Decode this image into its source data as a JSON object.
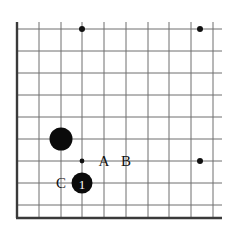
{
  "diagram": {
    "kind": "go-board-corner-diagram",
    "background_color": "#ffffff",
    "line_color": "#6e6e6e",
    "border_color": "#3a3a3a",
    "stone_color": "#0b0b0b",
    "number_color": "#ffffff",
    "label_color": "#111111",
    "grid": {
      "x_lines": [
        17,
        39,
        61,
        82,
        104,
        126,
        148,
        169,
        191,
        213
      ],
      "y_lines": [
        29,
        51,
        73,
        95,
        117,
        139,
        161,
        183,
        205
      ],
      "left_border_x": 17,
      "bottom_border_y": 218,
      "line_extent_right": 222,
      "line_extent_top": 22,
      "spacing": 21.8
    },
    "star_points": [
      {
        "name": "star-top-left",
        "x": 82,
        "y": 29
      },
      {
        "name": "star-top-right",
        "x": 200,
        "y": 29
      },
      {
        "name": "star-right",
        "x": 200,
        "y": 161
      }
    ],
    "marker_dots": [
      {
        "name": "intersection-dot",
        "x": 82,
        "y": 161,
        "r": 2.4
      }
    ],
    "stones": [
      {
        "name": "black-stone-plain",
        "color": "black",
        "x": 61,
        "y": 139,
        "r": 11.5,
        "number": ""
      },
      {
        "name": "black-stone-move-1",
        "color": "black",
        "x": 82,
        "y": 183,
        "r": 10.5,
        "number": "1"
      }
    ],
    "labels": [
      {
        "name": "label-a",
        "text": "A",
        "x": 104,
        "y": 161
      },
      {
        "name": "label-b",
        "text": "B",
        "x": 126,
        "y": 161
      },
      {
        "name": "label-c",
        "text": "C",
        "x": 61,
        "y": 183
      }
    ]
  }
}
